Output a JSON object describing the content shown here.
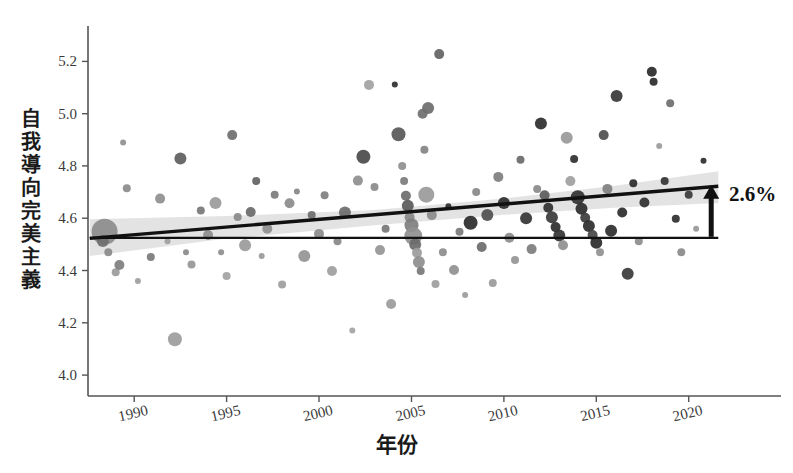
{
  "chart_data": {
    "type": "scatter",
    "title": "",
    "xlabel": "年份",
    "ylabel": "自我導向完美主義",
    "xlim": [
      1987.5,
      2021.8
    ],
    "ylim": [
      3.92,
      5.32
    ],
    "xticks": [
      1990,
      1995,
      2000,
      2005,
      2010,
      2015,
      2020
    ],
    "xticklabels": [
      "1990",
      "1995",
      "2000",
      "2005",
      "2010",
      "2015",
      "2020"
    ],
    "yticks": [
      4.0,
      4.2,
      4.4,
      4.6,
      4.8,
      5.0,
      5.2
    ],
    "yticklabels": [
      "4.0",
      "4.2",
      "4.4",
      "4.6",
      "4.8",
      "5.0",
      "5.2"
    ],
    "grid": false,
    "legend": null,
    "annotations": [
      {
        "name": "change-label",
        "text": "2.6%",
        "arrow": "up",
        "from_value": 4.525,
        "to_value": 4.72,
        "at_x": 2021.0
      }
    ],
    "reference_line": {
      "name": "baseline",
      "type": "horizontal",
      "y": 4.525,
      "color": "#111111"
    },
    "trend_line": {
      "name": "regression-line",
      "color": "#111111",
      "x_start": 1987.6,
      "y_start": 4.523,
      "x_end": 2021.6,
      "y_end": 4.722,
      "band_color": "#d9d9d9",
      "band_opacity": 0.75,
      "band": [
        {
          "x": 1987.6,
          "lo": 4.455,
          "hi": 4.596
        },
        {
          "x": 1995.0,
          "lo": 4.522,
          "hi": 4.608
        },
        {
          "x": 2003.0,
          "lo": 4.573,
          "hi": 4.632
        },
        {
          "x": 2010.0,
          "lo": 4.613,
          "hi": 4.676
        },
        {
          "x": 2016.0,
          "lo": 4.64,
          "hi": 4.724
        },
        {
          "x": 2021.6,
          "lo": 4.658,
          "hi": 4.78
        }
      ]
    },
    "marker_sizes_px": [
      2,
      3,
      4,
      5,
      6,
      7,
      8,
      9,
      11,
      13
    ],
    "marker_shades": [
      "#2a2a2a",
      "#3f3f3f",
      "#545454",
      "#6b6b6b",
      "#858585",
      "#9e9e9e",
      "#b0b0b0"
    ],
    "points": [
      {
        "x": 1988.4,
        "y": 4.548,
        "r": 13,
        "c": "#8c8c8c"
      },
      {
        "x": 1988.3,
        "y": 4.513,
        "r": 6,
        "c": "#6f6f6f"
      },
      {
        "x": 1988.6,
        "y": 4.47,
        "r": 4,
        "c": "#8a8a8a"
      },
      {
        "x": 1989.0,
        "y": 4.393,
        "r": 4,
        "c": "#9a9a9a"
      },
      {
        "x": 1989.2,
        "y": 4.421,
        "r": 5,
        "c": "#7e7e7e"
      },
      {
        "x": 1989.4,
        "y": 4.89,
        "r": 3,
        "c": "#8f8f8f"
      },
      {
        "x": 1989.6,
        "y": 4.715,
        "r": 4,
        "c": "#8b8b8b"
      },
      {
        "x": 1990.2,
        "y": 4.36,
        "r": 3,
        "c": "#9d9d9d"
      },
      {
        "x": 1990.9,
        "y": 4.452,
        "r": 4,
        "c": "#7a7a7a"
      },
      {
        "x": 1991.4,
        "y": 4.675,
        "r": 5,
        "c": "#8f8f8f"
      },
      {
        "x": 1991.8,
        "y": 4.512,
        "r": 3,
        "c": "#a0a0a0"
      },
      {
        "x": 1992.2,
        "y": 4.137,
        "r": 7,
        "c": "#9c9c9c"
      },
      {
        "x": 1992.5,
        "y": 4.828,
        "r": 6,
        "c": "#5e5e5e"
      },
      {
        "x": 1992.8,
        "y": 4.47,
        "r": 3,
        "c": "#8a8a8a"
      },
      {
        "x": 1993.1,
        "y": 4.423,
        "r": 4,
        "c": "#969696"
      },
      {
        "x": 1993.6,
        "y": 4.63,
        "r": 4,
        "c": "#777777"
      },
      {
        "x": 1994.0,
        "y": 4.536,
        "r": 5,
        "c": "#8d8d8d"
      },
      {
        "x": 1994.4,
        "y": 4.658,
        "r": 6,
        "c": "#9a9a9a"
      },
      {
        "x": 1994.7,
        "y": 4.47,
        "r": 3,
        "c": "#8e8e8e"
      },
      {
        "x": 1995.0,
        "y": 4.379,
        "r": 4,
        "c": "#a2a2a2"
      },
      {
        "x": 1995.3,
        "y": 4.918,
        "r": 5,
        "c": "#6e6e6e"
      },
      {
        "x": 1995.6,
        "y": 4.605,
        "r": 4,
        "c": "#8a8a8a"
      },
      {
        "x": 1996.0,
        "y": 4.497,
        "r": 6,
        "c": "#9a9a9a"
      },
      {
        "x": 1996.3,
        "y": 4.624,
        "r": 5,
        "c": "#6a6a6a"
      },
      {
        "x": 1996.6,
        "y": 4.742,
        "r": 4,
        "c": "#636363"
      },
      {
        "x": 1996.9,
        "y": 4.455,
        "r": 3,
        "c": "#999999"
      },
      {
        "x": 1997.2,
        "y": 4.56,
        "r": 5,
        "c": "#8f8f8f"
      },
      {
        "x": 1997.6,
        "y": 4.69,
        "r": 4,
        "c": "#7c7c7c"
      },
      {
        "x": 1998.0,
        "y": 4.346,
        "r": 4,
        "c": "#9d9d9d"
      },
      {
        "x": 1998.4,
        "y": 4.657,
        "r": 5,
        "c": "#8b8b8b"
      },
      {
        "x": 1998.8,
        "y": 4.702,
        "r": 3,
        "c": "#858585"
      },
      {
        "x": 1999.2,
        "y": 4.455,
        "r": 6,
        "c": "#949494"
      },
      {
        "x": 1999.6,
        "y": 4.612,
        "r": 4,
        "c": "#6d6d6d"
      },
      {
        "x": 2000.0,
        "y": 4.54,
        "r": 5,
        "c": "#8c8c8c"
      },
      {
        "x": 2000.3,
        "y": 4.688,
        "r": 4,
        "c": "#7f7f7f"
      },
      {
        "x": 2000.7,
        "y": 4.398,
        "r": 5,
        "c": "#9e9e9e"
      },
      {
        "x": 2001.0,
        "y": 4.512,
        "r": 4,
        "c": "#888888"
      },
      {
        "x": 2001.4,
        "y": 4.622,
        "r": 6,
        "c": "#6b6b6b"
      },
      {
        "x": 2001.8,
        "y": 4.17,
        "r": 3,
        "c": "#a3a3a3"
      },
      {
        "x": 2002.1,
        "y": 4.744,
        "r": 5,
        "c": "#8e8e8e"
      },
      {
        "x": 2002.4,
        "y": 4.835,
        "r": 7,
        "c": "#4a4a4a"
      },
      {
        "x": 2002.7,
        "y": 5.11,
        "r": 5,
        "c": "#a2a2a2"
      },
      {
        "x": 2003.0,
        "y": 4.72,
        "r": 4,
        "c": "#8a8a8a"
      },
      {
        "x": 2003.3,
        "y": 4.478,
        "r": 5,
        "c": "#959595"
      },
      {
        "x": 2003.6,
        "y": 4.56,
        "r": 4,
        "c": "#777777"
      },
      {
        "x": 2003.9,
        "y": 4.272,
        "r": 5,
        "c": "#9b9b9b"
      },
      {
        "x": 2004.1,
        "y": 5.112,
        "r": 3,
        "c": "#2f2f2f"
      },
      {
        "x": 2004.3,
        "y": 4.921,
        "r": 7,
        "c": "#585858"
      },
      {
        "x": 2004.5,
        "y": 4.8,
        "r": 4,
        "c": "#8f8f8f"
      },
      {
        "x": 2004.6,
        "y": 4.742,
        "r": 4,
        "c": "#7b7b7b"
      },
      {
        "x": 2004.7,
        "y": 4.686,
        "r": 5,
        "c": "#6c6c6c"
      },
      {
        "x": 2004.8,
        "y": 4.648,
        "r": 6,
        "c": "#5a5a5a"
      },
      {
        "x": 2004.9,
        "y": 4.604,
        "r": 5,
        "c": "#888888"
      },
      {
        "x": 2005.0,
        "y": 4.573,
        "r": 7,
        "c": "#7e7e7e"
      },
      {
        "x": 2005.1,
        "y": 4.532,
        "r": 9,
        "c": "#909090"
      },
      {
        "x": 2005.2,
        "y": 4.5,
        "r": 6,
        "c": "#6a6a6a"
      },
      {
        "x": 2005.3,
        "y": 4.468,
        "r": 5,
        "c": "#9c9c9c"
      },
      {
        "x": 2005.4,
        "y": 4.432,
        "r": 6,
        "c": "#8e8e8e"
      },
      {
        "x": 2005.5,
        "y": 4.398,
        "r": 4,
        "c": "#777777"
      },
      {
        "x": 2005.6,
        "y": 5.0,
        "r": 5,
        "c": "#6f6f6f"
      },
      {
        "x": 2005.7,
        "y": 4.862,
        "r": 4,
        "c": "#838383"
      },
      {
        "x": 2005.8,
        "y": 4.69,
        "r": 8,
        "c": "#9a9a9a"
      },
      {
        "x": 2005.9,
        "y": 5.022,
        "r": 6,
        "c": "#6d6d6d"
      },
      {
        "x": 2006.1,
        "y": 4.612,
        "r": 5,
        "c": "#8a8a8a"
      },
      {
        "x": 2006.3,
        "y": 4.348,
        "r": 4,
        "c": "#9e9e9e"
      },
      {
        "x": 2006.5,
        "y": 5.228,
        "r": 5,
        "c": "#636363"
      },
      {
        "x": 2006.7,
        "y": 4.47,
        "r": 4,
        "c": "#8c8c8c"
      },
      {
        "x": 2007.0,
        "y": 4.646,
        "r": 3,
        "c": "#2e2e2e"
      },
      {
        "x": 2007.3,
        "y": 4.402,
        "r": 5,
        "c": "#909090"
      },
      {
        "x": 2007.6,
        "y": 4.548,
        "r": 4,
        "c": "#7a7a7a"
      },
      {
        "x": 2007.9,
        "y": 4.306,
        "r": 3,
        "c": "#9b9b9b"
      },
      {
        "x": 2008.2,
        "y": 4.583,
        "r": 7,
        "c": "#2b2b2b"
      },
      {
        "x": 2008.5,
        "y": 4.7,
        "r": 4,
        "c": "#888888"
      },
      {
        "x": 2008.8,
        "y": 4.49,
        "r": 5,
        "c": "#6b6b6b"
      },
      {
        "x": 2009.1,
        "y": 4.612,
        "r": 6,
        "c": "#4e4e4e"
      },
      {
        "x": 2009.4,
        "y": 4.352,
        "r": 4,
        "c": "#9a9a9a"
      },
      {
        "x": 2009.7,
        "y": 4.758,
        "r": 5,
        "c": "#7e7e7e"
      },
      {
        "x": 2010.0,
        "y": 4.658,
        "r": 6,
        "c": "#2d2d2d"
      },
      {
        "x": 2010.3,
        "y": 4.525,
        "r": 5,
        "c": "#8d8d8d"
      },
      {
        "x": 2010.6,
        "y": 4.44,
        "r": 4,
        "c": "#959595"
      },
      {
        "x": 2010.9,
        "y": 4.824,
        "r": 4,
        "c": "#6a6a6a"
      },
      {
        "x": 2011.2,
        "y": 4.6,
        "r": 6,
        "c": "#343434"
      },
      {
        "x": 2011.5,
        "y": 4.482,
        "r": 5,
        "c": "#7c7c7c"
      },
      {
        "x": 2011.8,
        "y": 4.712,
        "r": 4,
        "c": "#8a8a8a"
      },
      {
        "x": 2012.0,
        "y": 4.962,
        "r": 6,
        "c": "#2c2c2c"
      },
      {
        "x": 2012.2,
        "y": 4.688,
        "r": 5,
        "c": "#5c5c5c"
      },
      {
        "x": 2012.4,
        "y": 4.64,
        "r": 5,
        "c": "#303030"
      },
      {
        "x": 2012.6,
        "y": 4.604,
        "r": 6,
        "c": "#3a3a3a"
      },
      {
        "x": 2012.8,
        "y": 4.566,
        "r": 5,
        "c": "#2e2e2e"
      },
      {
        "x": 2013.0,
        "y": 4.534,
        "r": 6,
        "c": "#343434"
      },
      {
        "x": 2013.2,
        "y": 4.497,
        "r": 5,
        "c": "#8f8f8f"
      },
      {
        "x": 2013.4,
        "y": 4.908,
        "r": 6,
        "c": "#999999"
      },
      {
        "x": 2013.6,
        "y": 4.742,
        "r": 5,
        "c": "#a0a0a0"
      },
      {
        "x": 2013.8,
        "y": 4.826,
        "r": 4,
        "c": "#2f2f2f"
      },
      {
        "x": 2014.0,
        "y": 4.68,
        "r": 7,
        "c": "#313131"
      },
      {
        "x": 2014.2,
        "y": 4.636,
        "r": 6,
        "c": "#2b2b2b"
      },
      {
        "x": 2014.4,
        "y": 4.602,
        "r": 5,
        "c": "#3c3c3c"
      },
      {
        "x": 2014.6,
        "y": 4.57,
        "r": 6,
        "c": "#2d2d2d"
      },
      {
        "x": 2014.8,
        "y": 4.536,
        "r": 5,
        "c": "#464646"
      },
      {
        "x": 2015.0,
        "y": 4.506,
        "r": 6,
        "c": "#2a2a2a"
      },
      {
        "x": 2015.2,
        "y": 4.47,
        "r": 4,
        "c": "#909090"
      },
      {
        "x": 2015.4,
        "y": 4.918,
        "r": 5,
        "c": "#4e4e4e"
      },
      {
        "x": 2015.6,
        "y": 4.712,
        "r": 5,
        "c": "#808080"
      },
      {
        "x": 2015.8,
        "y": 4.552,
        "r": 6,
        "c": "#2e2e2e"
      },
      {
        "x": 2016.1,
        "y": 5.068,
        "r": 6,
        "c": "#383838"
      },
      {
        "x": 2016.4,
        "y": 4.622,
        "r": 5,
        "c": "#2c2c2c"
      },
      {
        "x": 2016.7,
        "y": 4.388,
        "r": 6,
        "c": "#3a3a3a"
      },
      {
        "x": 2017.0,
        "y": 4.734,
        "r": 4,
        "c": "#2b2b2b"
      },
      {
        "x": 2017.3,
        "y": 4.512,
        "r": 4,
        "c": "#8d8d8d"
      },
      {
        "x": 2017.6,
        "y": 4.66,
        "r": 5,
        "c": "#303030"
      },
      {
        "x": 2018.0,
        "y": 5.16,
        "r": 5,
        "c": "#2a2a2a"
      },
      {
        "x": 2018.1,
        "y": 5.122,
        "r": 4,
        "c": "#2a2a2a"
      },
      {
        "x": 2018.4,
        "y": 4.876,
        "r": 3,
        "c": "#9b9b9b"
      },
      {
        "x": 2018.7,
        "y": 4.742,
        "r": 4,
        "c": "#333333"
      },
      {
        "x": 2019.0,
        "y": 5.04,
        "r": 4,
        "c": "#6e6e6e"
      },
      {
        "x": 2019.3,
        "y": 4.598,
        "r": 4,
        "c": "#2f2f2f"
      },
      {
        "x": 2019.6,
        "y": 4.47,
        "r": 4,
        "c": "#8a8a8a"
      },
      {
        "x": 2020.0,
        "y": 4.69,
        "r": 4,
        "c": "#383838"
      },
      {
        "x": 2020.4,
        "y": 4.56,
        "r": 3,
        "c": "#999999"
      },
      {
        "x": 2020.8,
        "y": 4.82,
        "r": 3,
        "c": "#2d2d2d"
      }
    ]
  }
}
